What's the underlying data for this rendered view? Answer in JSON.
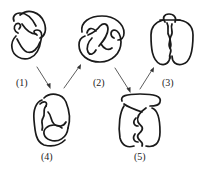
{
  "knots": [
    {
      "id": "1",
      "label": "(1)"
    },
    {
      "id": "2",
      "label": "(2)"
    },
    {
      "id": "3",
      "label": "(3)"
    },
    {
      "id": "4",
      "label": "(4)"
    },
    {
      "id": "5",
      "label": "(5)"
    }
  ],
  "arrows": [
    {
      "from": "1",
      "to": "4"
    },
    {
      "from": "4",
      "to": "2"
    },
    {
      "from": "2",
      "to": "5"
    },
    {
      "from": "5",
      "to": "3"
    }
  ],
  "colors": {
    "stroke": "#1a1a1a",
    "background": "#ffffff"
  }
}
